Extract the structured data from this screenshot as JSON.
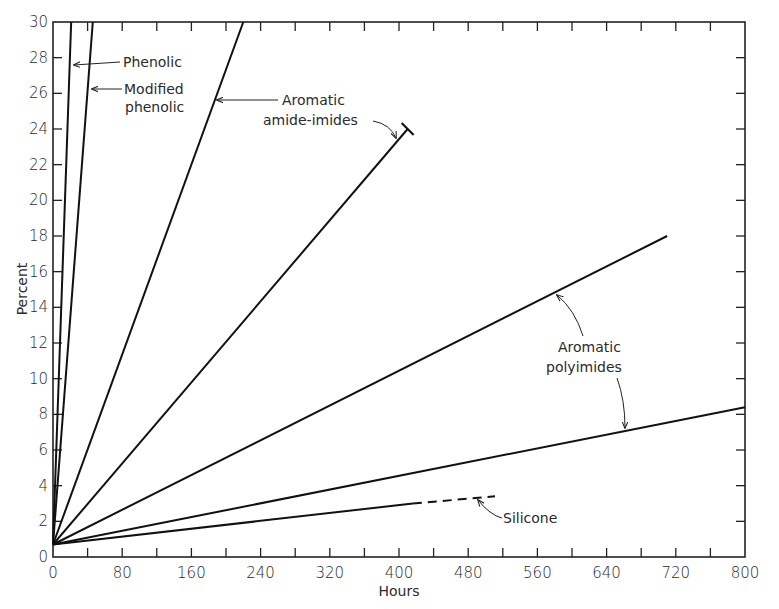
{
  "chart_data": {
    "type": "line",
    "title": "",
    "xlabel": "Hours",
    "ylabel": "Percent",
    "xlim": [
      0,
      800
    ],
    "ylim": [
      0,
      30
    ],
    "x_ticks": [
      0,
      80,
      160,
      240,
      320,
      400,
      480,
      560,
      640,
      720,
      800
    ],
    "x_minor_ticks": [
      40,
      120,
      200,
      280,
      360,
      440,
      520,
      600,
      680,
      760
    ],
    "y_ticks": [
      0,
      2,
      4,
      6,
      8,
      10,
      12,
      14,
      16,
      18,
      20,
      22,
      24,
      26,
      28,
      30
    ],
    "grid": false,
    "legend": "none (inline annotations)",
    "series": [
      {
        "name": "Phenolic",
        "x": [
          0,
          21
        ],
        "y": [
          0.7,
          30
        ],
        "style": "solid"
      },
      {
        "name": "Modified phenolic",
        "x": [
          0,
          46
        ],
        "y": [
          0.7,
          30
        ],
        "style": "solid"
      },
      {
        "name": "Aromatic amide-imides (1)",
        "x": [
          0,
          220
        ],
        "y": [
          0.7,
          30
        ],
        "style": "solid"
      },
      {
        "name": "Aromatic amide-imides (2)",
        "x": [
          0,
          410
        ],
        "y": [
          0.7,
          24
        ],
        "style": "solid"
      },
      {
        "name": "Aromatic polyimides (1)",
        "x": [
          0,
          710
        ],
        "y": [
          0.7,
          18
        ],
        "style": "solid"
      },
      {
        "name": "Aromatic polyimides (2)",
        "x": [
          0,
          800
        ],
        "y": [
          0.7,
          8.4
        ],
        "style": "solid"
      },
      {
        "name": "Silicone (measured)",
        "x": [
          0,
          416
        ],
        "y": [
          0.7,
          3.0
        ],
        "style": "solid"
      },
      {
        "name": "Silicone (extrapolated)",
        "x": [
          416,
          511
        ],
        "y": [
          3.0,
          3.4
        ],
        "style": "dashed"
      }
    ],
    "annotations": [
      {
        "text": "Phenolic",
        "target": "Phenolic"
      },
      {
        "text": "Modified phenolic",
        "target": "Modified phenolic"
      },
      {
        "text": "Aromatic amide-imides",
        "target": "Aromatic amide-imides"
      },
      {
        "text": "Aromatic polyimides",
        "target": "Aromatic polyimides"
      },
      {
        "text": "Silicone",
        "target": "Silicone"
      }
    ]
  },
  "labels": {
    "xlabel": "Hours",
    "ylabel": "Percent",
    "phenolic": "Phenolic",
    "modified_1": "Modified",
    "modified_2": "phenolic",
    "amide_1": "Aromatic",
    "amide_2": "amide-imides",
    "poly_1": "Aromatic",
    "poly_2": "polyimides",
    "silicone": "Silicone"
  }
}
